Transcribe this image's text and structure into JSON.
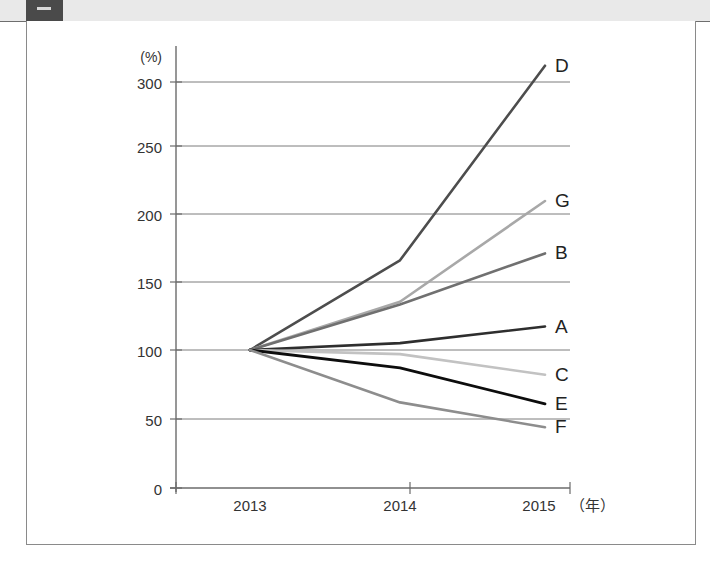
{
  "window": {
    "tab_fragment_color": "#4a4a4a",
    "strip_color": "#e9e9e9"
  },
  "chart_data": {
    "type": "line",
    "title": "",
    "subtitle": "",
    "xlabel": "(年)",
    "ylabel": "(%)",
    "unit_label_y": "(%)",
    "unit_label_x": "（年）",
    "categories": [
      "2013",
      "2014",
      "2015"
    ],
    "x": [
      2013,
      2014,
      2015
    ],
    "xlim": [
      2012.75,
      2015.25
    ],
    "ylim": [
      0,
      315
    ],
    "yticks": [
      0,
      50,
      100,
      150,
      200,
      250,
      300
    ],
    "ytick_labels": [
      "0",
      "50",
      "100",
      "150",
      "200",
      "250",
      "300"
    ],
    "xtick_labels": [
      "2013",
      "2014",
      "2015"
    ],
    "grid": "horizontal",
    "legend": "right-inline-labels",
    "series": [
      {
        "name": "D",
        "label": "D",
        "color": "#4d4d4d",
        "width": 2.6,
        "values": [
          100,
          165,
          306
        ]
      },
      {
        "name": "G",
        "label": "G",
        "color": "#a8a8a8",
        "width": 2.6,
        "values": [
          100,
          135,
          208
        ]
      },
      {
        "name": "B",
        "label": "B",
        "color": "#707070",
        "width": 2.6,
        "values": [
          100,
          133,
          170
        ]
      },
      {
        "name": "A",
        "label": "A",
        "color": "#2e2e2e",
        "width": 2.6,
        "values": [
          100,
          105,
          117
        ]
      },
      {
        "name": "C",
        "label": "C",
        "color": "#c2c2c2",
        "width": 2.6,
        "values": [
          100,
          97,
          82
        ]
      },
      {
        "name": "E",
        "label": "E",
        "color": "#0d0d0d",
        "width": 2.8,
        "values": [
          100,
          87,
          61
        ]
      },
      {
        "name": "F",
        "label": "F",
        "color": "#8d8d8d",
        "width": 2.6,
        "values": [
          100,
          62,
          44
        ]
      }
    ]
  },
  "labels": {
    "y_unit": "(%)",
    "x_unit": "（年）",
    "y_0": "0",
    "y_50": "50",
    "y_100": "100",
    "y_150": "150",
    "y_200": "200",
    "y_250": "250",
    "y_300": "300",
    "x_2013": "2013",
    "x_2014": "2014",
    "x_2015": "2015",
    "series_A": "A",
    "series_B": "B",
    "series_C": "C",
    "series_D": "D",
    "series_E": "E",
    "series_F": "F",
    "series_G": "G"
  }
}
